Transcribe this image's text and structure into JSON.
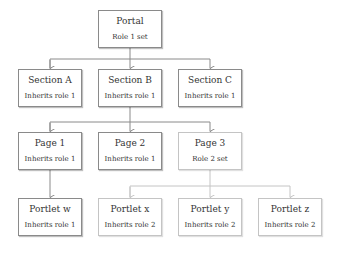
{
  "diagram": {
    "colors": {
      "role1_line": "#8a8a8a",
      "role2_line": "#c4c4c4"
    },
    "nodes": {
      "portal": {
        "title": "Portal",
        "subtitle": "Role 1 set"
      },
      "sectionA": {
        "title": "Section A",
        "subtitle": "Inherits role 1"
      },
      "sectionB": {
        "title": "Section B",
        "subtitle": "Inherits role 1"
      },
      "sectionC": {
        "title": "Section C",
        "subtitle": "Inherits role 1"
      },
      "page1": {
        "title": "Page 1",
        "subtitle": "Inherits role 1"
      },
      "page2": {
        "title": "Page 2",
        "subtitle": "Inherits role 1"
      },
      "page3": {
        "title": "Page 3",
        "subtitle": "Role 2 set"
      },
      "portletW": {
        "title": "Portlet w",
        "subtitle": "Inherits role 1"
      },
      "portletX": {
        "title": "Portlet x",
        "subtitle": "Inherits role 2"
      },
      "portletY": {
        "title": "Portlet y",
        "subtitle": "Inherits role 2"
      },
      "portletZ": {
        "title": "Portlet z",
        "subtitle": "Inherits role 2"
      }
    },
    "edges": [
      [
        "portal",
        "sectionA"
      ],
      [
        "portal",
        "sectionB"
      ],
      [
        "portal",
        "sectionC"
      ],
      [
        "sectionB",
        "page1"
      ],
      [
        "sectionB",
        "page2"
      ],
      [
        "sectionB",
        "page3"
      ],
      [
        "page1",
        "portletW"
      ],
      [
        "page3",
        "portletX"
      ],
      [
        "page3",
        "portletY"
      ],
      [
        "page3",
        "portletZ"
      ]
    ]
  }
}
